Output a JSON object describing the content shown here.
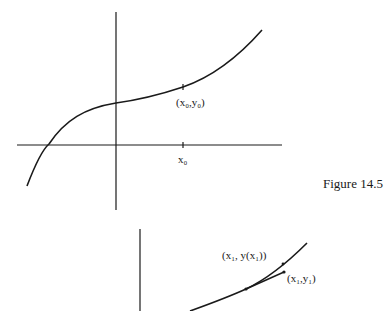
{
  "figure": {
    "caption": "Figure 14.5",
    "top_panel": {
      "point_label": "(x₀,y₀)",
      "tick_label": "x₀"
    },
    "bottom_panel": {
      "true_point_label": "(x₁, y(x₁))",
      "approx_point_label": "(x₁,y₁)"
    }
  },
  "colors": {
    "ink": "#1a1a1a",
    "background": "#ffffff"
  }
}
